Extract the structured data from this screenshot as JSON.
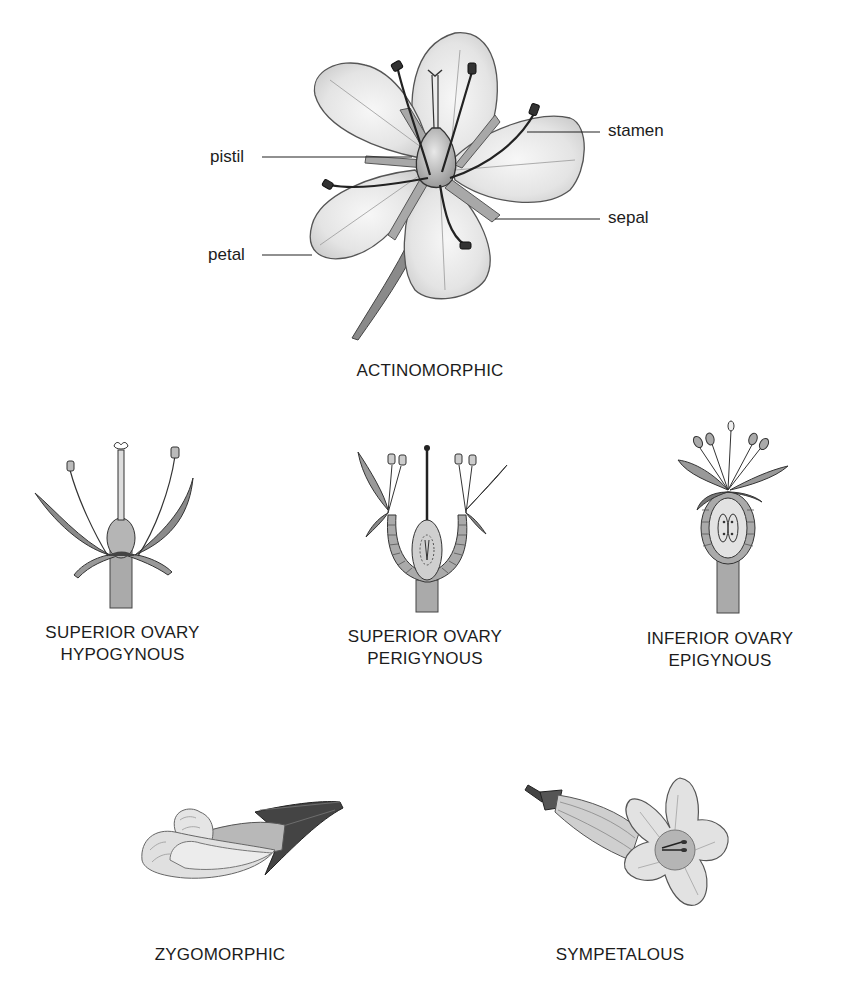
{
  "diagram": {
    "title_hidden": "",
    "main_flower": {
      "caption": "ACTINOMORPHIC",
      "callouts": [
        {
          "id": "pistil",
          "text": "pistil",
          "side": "left"
        },
        {
          "id": "petal",
          "text": "petal",
          "side": "left"
        },
        {
          "id": "stamen",
          "text": "stamen",
          "side": "right"
        },
        {
          "id": "sepal",
          "text": "sepal",
          "side": "right"
        }
      ]
    },
    "ovary_types": [
      {
        "line1": "SUPERIOR OVARY",
        "line2": "HYPOGYNOUS"
      },
      {
        "line1": "SUPERIOR OVARY",
        "line2": "PERIGYNOUS"
      },
      {
        "line1": "INFERIOR OVARY",
        "line2": "EPIGYNOUS"
      }
    ],
    "flower_forms": [
      {
        "caption": "ZYGOMORPHIC"
      },
      {
        "caption": "SYMPETALOUS"
      }
    ],
    "colors": {
      "background": "#ffffff",
      "ink": "#1c1c1c",
      "petal_fill": "#e6e6e6",
      "petal_shade": "#c8c8c8",
      "dark_fill": "#555555"
    }
  }
}
